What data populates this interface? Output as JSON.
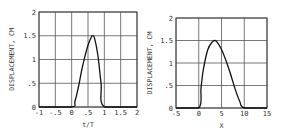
{
  "chart_data": [
    {
      "type": "line",
      "title": "",
      "xlabel": "t/T",
      "ylabel": "DISPLACEMENT, CM",
      "xlim": [
        -1,
        2
      ],
      "ylim": [
        0,
        2
      ],
      "xticks": [
        "-1",
        "-.5",
        "0",
        ".5",
        "1",
        "1.5",
        "2"
      ],
      "yticks": [
        "0",
        ".5",
        "1",
        "1.5",
        "2"
      ],
      "grid": true,
      "x": [
        -1,
        0,
        0.1,
        0.2,
        0.3,
        0.4,
        0.5,
        0.6,
        0.65,
        0.7,
        0.8,
        0.9,
        1.0,
        2
      ],
      "y": [
        0,
        0,
        0.12,
        0.4,
        0.75,
        1.05,
        1.3,
        1.47,
        1.5,
        1.45,
        1.1,
        0.5,
        0,
        0
      ]
    },
    {
      "type": "line",
      "title": "",
      "xlabel": "X",
      "ylabel": "DISPLACEMENT, CM",
      "xlim": [
        -5,
        15
      ],
      "ylim": [
        0,
        2
      ],
      "xticks": [
        "-5",
        "0",
        "5",
        "10",
        "15"
      ],
      "yticks": [
        "0",
        ".5",
        "1",
        "1.5",
        "2"
      ],
      "grid": true,
      "x": [
        -5,
        0,
        0.5,
        1,
        2,
        3,
        3.5,
        4,
        5,
        6,
        7,
        8,
        9,
        10,
        15
      ],
      "y": [
        0,
        0,
        0.45,
        0.85,
        1.3,
        1.47,
        1.5,
        1.47,
        1.3,
        1.05,
        0.75,
        0.42,
        0.15,
        0,
        0
      ]
    }
  ]
}
